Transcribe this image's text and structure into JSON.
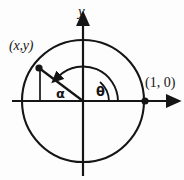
{
  "figure": {
    "type": "geometry-diagram",
    "background_color": "#fdfdfd",
    "stroke_color": "#151515"
  },
  "axes": {
    "y_label": "y",
    "x_label": "",
    "x_axis": {
      "x_start": 12,
      "x_end": 174,
      "y": 101,
      "arrow": "right"
    },
    "y_axis": {
      "y_start": 18,
      "y_end": 176,
      "x": 83,
      "arrow": "up"
    }
  },
  "circle": {
    "center_x": 83,
    "center_y": 101,
    "radius": 61,
    "name": "unit-circle"
  },
  "points": [
    {
      "id": "point-xy",
      "label": "(x,y)",
      "x": 39,
      "y": 68,
      "label_x": 9,
      "label_y": 39
    },
    {
      "id": "point-one-zero",
      "label": "(1, 0)",
      "x": 145,
      "y": 101,
      "label_x": 145,
      "label_y": 76
    }
  ],
  "angles": [
    {
      "id": "angle-theta",
      "label": "θ",
      "description": "acute angle from positive x-axis to terminal ray",
      "arc_radius": 26,
      "label_x": 96,
      "label_y": 85
    },
    {
      "id": "angle-alpha",
      "label": "α",
      "description": "reflex arc with counterclockwise arrowhead to terminal ray",
      "arc_radius": 35,
      "label_x": 56,
      "label_y": 87
    }
  ],
  "segments": [
    {
      "id": "terminal-ray",
      "description": "radius from origin to point (x,y)"
    },
    {
      "id": "drop-line",
      "description": "vertical segment from point (x,y) down to x-axis"
    }
  ]
}
